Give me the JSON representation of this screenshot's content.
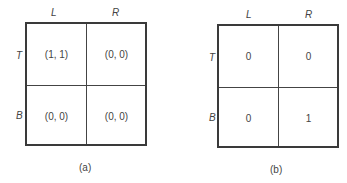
{
  "figures": [
    {
      "caption": "(a)",
      "columns": [
        "L",
        "R"
      ],
      "rows": [
        "T",
        "B"
      ],
      "cells": [
        [
          "(1, 1)",
          "(0, 0)"
        ],
        [
          "(0, 0)",
          "(0, 0)"
        ]
      ]
    },
    {
      "caption": "(b)",
      "columns": [
        "L",
        "R"
      ],
      "rows": [
        "T",
        "B"
      ],
      "cells": [
        [
          "0",
          "0"
        ],
        [
          "0",
          "1"
        ]
      ]
    }
  ]
}
